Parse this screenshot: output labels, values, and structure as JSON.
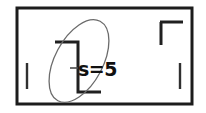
{
  "figure": {
    "kind": "hand-drawn-sketch",
    "background_color": "#ffffff",
    "ink_color": "#1c1c1c",
    "frame": {
      "name": "outer-rectangle-border",
      "x": 17,
      "y": 8,
      "width": 175,
      "height": 96,
      "stroke_width": 3,
      "color": "#1c1c1c"
    },
    "annotation": {
      "label": "s=5",
      "x": 78,
      "y": 76,
      "font_size": 19,
      "color": "#111111"
    },
    "marks": [
      {
        "name": "center-bracket-polyline",
        "type": "polyline",
        "points": "55,42 78,42 78,92 101,92",
        "stroke_width": 3,
        "color": "#202020"
      },
      {
        "name": "top-right-corner-mark",
        "type": "polyline",
        "points": "160,22 182,22 182,22",
        "stroke_width": 3,
        "color": "#202020"
      },
      {
        "name": "top-right-corner-vertical",
        "type": "line",
        "x1": 161,
        "y1": 22,
        "x2": 161,
        "y2": 45,
        "stroke_width": 3,
        "color": "#202020"
      },
      {
        "name": "left-tick-mark",
        "type": "line",
        "x1": 27,
        "y1": 63,
        "x2": 27,
        "y2": 89,
        "stroke_width": 2.4,
        "color": "#303030"
      },
      {
        "name": "right-tick-mark",
        "type": "line",
        "x1": 180,
        "y1": 63,
        "x2": 180,
        "y2": 89,
        "stroke_width": 2.4,
        "color": "#303030"
      },
      {
        "name": "label-leader-tick",
        "type": "line",
        "x1": 70,
        "y1": 68,
        "x2": 78,
        "y2": 68,
        "stroke_width": 1.6,
        "color": "#4a4a4a"
      }
    ],
    "ellipse": {
      "name": "selection-ellipse",
      "cx": 79,
      "cy": 61,
      "rx": 24,
      "ry": 45,
      "rotation_deg": 28,
      "stroke_width": 1.3,
      "color": "#6b6b6b"
    }
  }
}
